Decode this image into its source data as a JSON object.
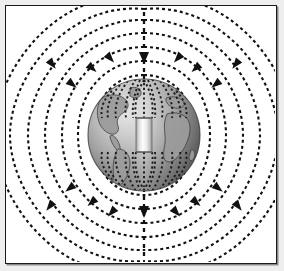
{
  "figure": {
    "title": "Earth's magnetic field as a dipole bar magnet",
    "background_color": "#ffffff",
    "outer_background_color": "#eeeeee",
    "frame_border_color": "#1a1a1a",
    "field_line_color": "#111111",
    "axis_label": "magnetic-axis"
  },
  "globe": {
    "name": "earth-globe",
    "center_x": 143,
    "center_y": 134,
    "radius": 56,
    "light_color": "#d8d8d8",
    "mid_color": "#9a9a9a",
    "dark_color": "#4a4a4a",
    "continent_color": "#8f8f8f",
    "continent_outline_color": "#3b3b3b",
    "continents": [
      "North America",
      "South America",
      "Europe",
      "Africa"
    ]
  },
  "magnet": {
    "name": "bar-magnet",
    "center_x": 143,
    "center_y": 134,
    "width": 16,
    "height": 34,
    "top_color": "#f2f2f2",
    "mid_color": "#fdfdfd",
    "bottom_color": "#b4b4b4",
    "edge_color": "#6e6e6e"
  },
  "field": {
    "name": "magnetic-field-lines",
    "line_count_per_side": 7,
    "dash_pattern": "3 3",
    "stroke_width": 2.1,
    "color": "#111111",
    "arrow_direction": "downward",
    "loop_extents_x": [
      22,
      264
    ],
    "axis": {
      "name": "vertical-dipole-axis",
      "x": 143,
      "top_y": 12,
      "bottom_y": 256,
      "dash_pattern": "4 4"
    },
    "loops": [
      {
        "id": 1,
        "half_width": 22,
        "top_y": 74,
        "bottom_y": 194
      },
      {
        "id": 2,
        "half_width": 36,
        "top_y": 60,
        "bottom_y": 208
      },
      {
        "id": 3,
        "half_width": 52,
        "top_y": 46,
        "bottom_y": 222
      },
      {
        "id": 4,
        "half_width": 69,
        "top_y": 32,
        "bottom_y": 236
      },
      {
        "id": 5,
        "half_width": 86,
        "top_y": 19,
        "bottom_y": 249
      },
      {
        "id": 6,
        "half_width": 102,
        "top_y": 8,
        "bottom_y": 259
      },
      {
        "id": 7,
        "half_width": 118,
        "top_y": -2,
        "bottom_y": 268
      }
    ]
  },
  "polar_spray": {
    "name": "polar-field-concentration",
    "north_label": "north-pole-converging-lines",
    "south_label": "south-pole-converging-lines",
    "dot_color": "#1c1c1c"
  }
}
